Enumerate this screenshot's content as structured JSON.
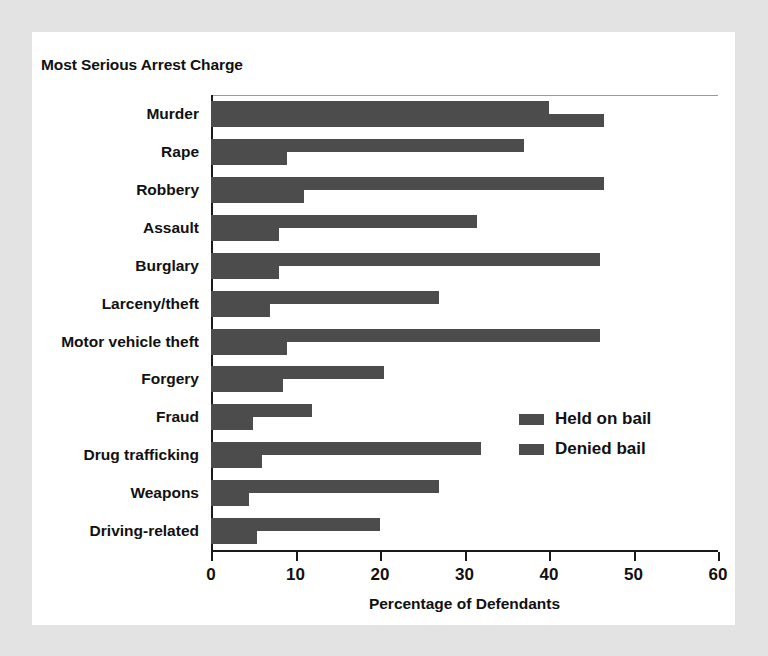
{
  "chart_data": {
    "type": "bar",
    "orientation": "horizontal",
    "title": "Most Serious Arrest Charge",
    "xlabel": "Percentage of Defendants",
    "ylabel": "",
    "xlim": [
      0,
      60
    ],
    "xticks": [
      0,
      10,
      20,
      30,
      40,
      50,
      60
    ],
    "xtick_labels": [
      "0",
      "10",
      "20",
      "30",
      "40",
      "50",
      "60"
    ],
    "grid": false,
    "legend_position": "middle-right",
    "bar_color": "#4c4c4c",
    "categories": [
      "Murder",
      "Rape",
      "Robbery",
      "Assault",
      "Burglary",
      "Larceny/theft",
      "Motor vehicle theft",
      "Forgery",
      "Fraud",
      "Drug trafficking",
      "Weapons",
      "Driving-related"
    ],
    "series": [
      {
        "name": "Held on bail",
        "values": [
          40,
          37,
          46.5,
          31.5,
          46,
          27,
          46,
          20.5,
          12,
          32,
          27,
          20
        ]
      },
      {
        "name": "Denied bail",
        "values": [
          46.5,
          9,
          11,
          8,
          8,
          7,
          9,
          8.5,
          5,
          6,
          4.5,
          5.5
        ]
      }
    ]
  },
  "legend": {
    "items": [
      {
        "label": "Held on bail"
      },
      {
        "label": "Denied bail"
      }
    ]
  }
}
